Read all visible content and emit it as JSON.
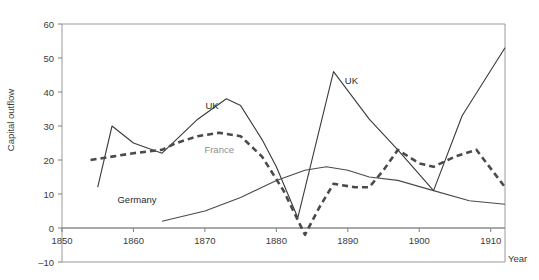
{
  "chart_data": {
    "type": "line",
    "title": "",
    "subtitle": "",
    "xlabel": "Year",
    "ylabel": "Capital outflow",
    "xlim": [
      1850,
      1912
    ],
    "ylim": [
      -10,
      60
    ],
    "xticks": [
      1850,
      1860,
      1870,
      1880,
      1890,
      1900,
      1910
    ],
    "xtick_labels": [
      "1850",
      "1860",
      "1870",
      "1880",
      "1890",
      "1900",
      "1910"
    ],
    "yticks": [
      -10,
      0,
      10,
      20,
      30,
      40,
      50,
      60
    ],
    "ytick_labels": [
      "–10",
      "0",
      "10",
      "20",
      "30",
      "40",
      "50",
      "60"
    ],
    "grid": false,
    "legend_position": "inline-annotations",
    "axis_frame": "box",
    "zero_line": true,
    "series": [
      {
        "name": "UK",
        "style": "solid",
        "color": "#3a3a3a",
        "label_color": "#2b2b2b",
        "label_x": 1871,
        "label_y": 35,
        "label_x2": 1890.5,
        "label_y2": 42.5,
        "x": [
          1855,
          1857,
          1860,
          1864,
          1866,
          1869,
          1873,
          1875,
          1878,
          1880,
          1883,
          1888,
          1893,
          1897,
          1902,
          1906,
          1912
        ],
        "y": [
          12,
          30,
          25,
          22,
          26,
          32,
          38,
          36,
          26,
          18,
          3,
          46,
          32,
          23,
          11,
          33,
          53
        ]
      },
      {
        "name": "France",
        "style": "dashed",
        "color": "#4a4a4a",
        "label_color": "#8e8e8e",
        "label_x": 1872,
        "label_y": 22,
        "x": [
          1854,
          1857,
          1860,
          1864,
          1866,
          1869,
          1872,
          1875,
          1878,
          1881,
          1884,
          1886,
          1888,
          1891,
          1893,
          1895,
          1897,
          1900,
          1902,
          1905,
          1908,
          1912
        ],
        "y": [
          20,
          21,
          22,
          23,
          25,
          27,
          28,
          27,
          21,
          11,
          -2,
          6,
          13,
          12,
          12,
          17,
          23,
          19,
          18,
          21,
          23,
          12
        ]
      },
      {
        "name": "Germany",
        "style": "solid",
        "color": "#4a4a4a",
        "label_color": "#3b3b3b",
        "label_x": 1860.5,
        "label_y": 7.5,
        "x": [
          1864,
          1870,
          1875,
          1880,
          1884,
          1887,
          1890,
          1893,
          1897,
          1902,
          1907,
          1912
        ],
        "y": [
          2,
          5,
          9,
          14,
          17,
          18,
          17,
          15,
          14,
          11,
          8,
          7
        ]
      }
    ]
  }
}
